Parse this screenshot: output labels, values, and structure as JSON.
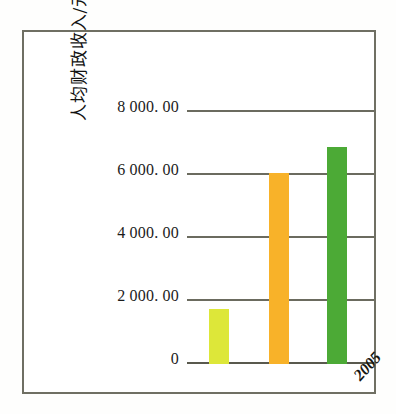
{
  "chart_data": {
    "type": "bar",
    "title": "",
    "subtitle": "",
    "xlabel": "",
    "ylabel": "人均财政收入/元",
    "categories": [
      "2005",
      "2010",
      "2016"
    ],
    "values": [
      1750,
      6050,
      6900
    ],
    "series": [
      {
        "name": "人均财政收入",
        "values": [
          1750,
          6050,
          6900
        ]
      }
    ],
    "ylim": [
      0,
      8000
    ],
    "ytick_values": [
      0,
      2000,
      4000,
      6000,
      8000
    ],
    "ytick_labels": [
      "0",
      "2 000. 00",
      "4 000. 00",
      "6 000. 00",
      "8 000. 00"
    ],
    "grid": true,
    "legend": false,
    "legend_position": "none",
    "bar_colors": [
      "#dde739",
      "#f8b229",
      "#4caa36"
    ],
    "colors": {
      "bar_2005": "#dde739",
      "bar_2010": "#f8b229",
      "bar_2016": "#4caa36",
      "grid": "#6b6b5f",
      "axis": "#59594e",
      "frame": "#6f6f63",
      "background": "#ffffff",
      "text": "#1b1b1b"
    }
  },
  "axis": {
    "y": {
      "ticks": [
        {
          "label": "8 000. 00",
          "value": 8000
        },
        {
          "label": "6 000. 00",
          "value": 6000
        },
        {
          "label": "4 000. 00",
          "value": 4000
        },
        {
          "label": "2 000. 00",
          "value": 2000
        },
        {
          "label": "0",
          "value": 0
        }
      ],
      "title": "人均财政收入/元"
    },
    "x": {
      "ticks": [
        {
          "label": "2005"
        },
        {
          "label": "2010"
        },
        {
          "label": "2016"
        }
      ]
    }
  }
}
